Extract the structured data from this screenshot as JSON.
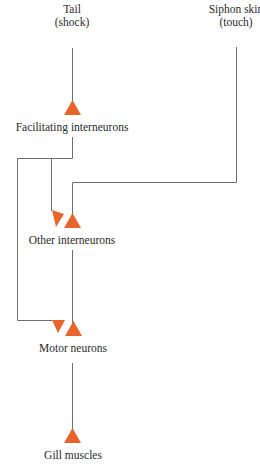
{
  "diagram": {
    "title": "",
    "colors": {
      "line": "#6e6e6e",
      "synapse": "#e8642a",
      "text": "#2a2a2a"
    },
    "nodes": {
      "tail": {
        "label": "Tail",
        "sublabel": "(shock)"
      },
      "siphon": {
        "label": "Siphon skin",
        "sublabel": "(touch)"
      },
      "facilitating": {
        "label": "Facilitating interneurons"
      },
      "other": {
        "label": "Other interneurons"
      },
      "motor": {
        "label": "Motor neurons"
      },
      "gill": {
        "label": "Gill muscles"
      }
    },
    "edges": [
      {
        "from": "Tail (shock)",
        "to": "Facilitating interneurons",
        "type": "excitatory"
      },
      {
        "from": "Siphon skin (touch)",
        "to": "Other interneurons",
        "type": "excitatory"
      },
      {
        "from": "Facilitating interneurons",
        "to": "Other interneurons",
        "type": "facilitating"
      },
      {
        "from": "Facilitating interneurons",
        "to": "Motor neurons",
        "type": "facilitating"
      },
      {
        "from": "Other interneurons",
        "to": "Motor neurons",
        "type": "excitatory"
      },
      {
        "from": "Motor neurons",
        "to": "Gill muscles",
        "type": "excitatory"
      }
    ]
  }
}
